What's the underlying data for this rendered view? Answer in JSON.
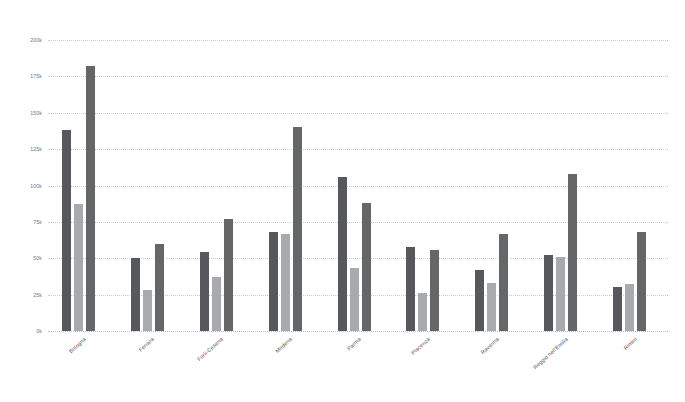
{
  "chart_data": {
    "type": "bar",
    "title": "",
    "subtitle": "",
    "xlabel": "",
    "ylabel": "",
    "grid": true,
    "legend_position": "none",
    "ylim": [
      0,
      200000
    ],
    "ytick_labels": [
      "200k",
      "175k",
      "150k",
      "125k",
      "100k",
      "75k",
      "50k",
      "25k",
      "0k"
    ],
    "ytick_values": [
      200000,
      175000,
      150000,
      125000,
      100000,
      75000,
      50000,
      25000,
      0
    ],
    "categories": [
      "Bologna",
      "Ferrara",
      "Forlì-Cesena",
      "Modena",
      "Parma",
      "Piacenza",
      "Ravenna",
      "Reggio nell'Emilia",
      "Rimini"
    ],
    "series": [
      {
        "name": "Series 1",
        "color": "#56585c",
        "values": [
          138000,
          50000,
          54000,
          68000,
          106000,
          58000,
          42000,
          52000,
          30000
        ]
      },
      {
        "name": "Series 2",
        "color": "#a8aaad",
        "values": [
          87000,
          28000,
          37000,
          67000,
          43000,
          26000,
          33000,
          51000,
          32000
        ]
      },
      {
        "name": "Series 3",
        "color": "#646668",
        "values": [
          182000,
          60000,
          77000,
          140000,
          88000,
          56000,
          67000,
          108000,
          68000
        ]
      }
    ]
  }
}
